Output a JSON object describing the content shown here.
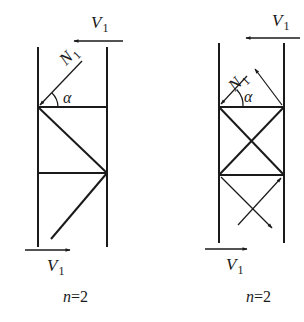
{
  "colors": {
    "line": "#1a1a1a",
    "background": "#ffffff"
  },
  "left_panel": {
    "top_shear": {
      "symbol": "V",
      "subscript": "1",
      "direction": "left"
    },
    "diagonal_force": {
      "symbol": "N",
      "subscript": "1"
    },
    "angle": "α",
    "bottom_shear": {
      "symbol": "V",
      "subscript": "1",
      "direction": "right"
    },
    "caption": {
      "var": "n",
      "rest": "=2"
    },
    "bracing": "single diagonal"
  },
  "right_panel": {
    "top_shear": {
      "symbol": "V",
      "subscript": "1",
      "direction": "left"
    },
    "diagonal_force": {
      "symbol": "N",
      "subscript": "1"
    },
    "angle": "α",
    "bottom_shear": {
      "symbol": "V",
      "subscript": "1",
      "direction": "right"
    },
    "caption": {
      "var": "n",
      "rest": "=2"
    },
    "bracing": "cross (X) diagonals"
  }
}
